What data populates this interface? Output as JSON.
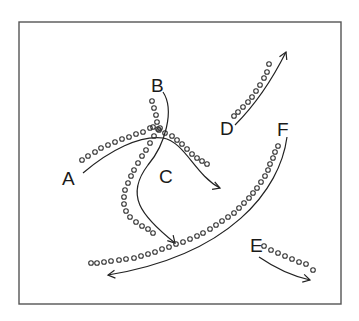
{
  "diagram": {
    "frame": {
      "x": 19,
      "y": 22,
      "width": 322,
      "height": 282,
      "stroke": "#555555"
    },
    "labels": [
      {
        "id": "A",
        "text": "A",
        "x": 62,
        "y": 185
      },
      {
        "id": "B",
        "text": "B",
        "x": 151,
        "y": 92
      },
      {
        "id": "C",
        "text": "C",
        "x": 159,
        "y": 183
      },
      {
        "id": "D",
        "text": "D",
        "x": 220,
        "y": 135
      },
      {
        "id": "E",
        "text": "E",
        "x": 250,
        "y": 252
      },
      {
        "id": "F",
        "text": "F",
        "x": 277,
        "y": 136
      }
    ],
    "paths": [
      {
        "id": "A",
        "d": "M83,173 C110,150 140,135 163,138 C185,142 195,175 220,188",
        "arrow_end": [
          220,
          188
        ],
        "arrow_dir": [
          1,
          0.35
        ]
      },
      {
        "id": "B",
        "d": "M163,92 C175,110 165,145 148,165 C125,195 140,215 175,243",
        "arrow_end": [
          175,
          243
        ],
        "arrow_dir": [
          0.7,
          0.75
        ]
      },
      {
        "id": "D",
        "d": "M235,125 C255,105 272,80 286,52",
        "arrow_end": [
          286,
          52
        ],
        "arrow_dir": [
          0.45,
          -1
        ]
      },
      {
        "id": "F",
        "d": "M287,137 C280,190 230,255 108,275",
        "arrow_end": [
          108,
          275
        ],
        "arrow_dir": [
          -1,
          0.12
        ]
      },
      {
        "id": "E",
        "d": "M259,257 C275,268 292,276 310,280",
        "arrow_end": [
          310,
          280
        ],
        "arrow_dir": [
          1,
          0.25
        ]
      }
    ],
    "dot_rows": [
      {
        "id": "A-dots",
        "points": [
          [
            82,
            160
          ],
          [
            88,
            156
          ],
          [
            95,
            152
          ],
          [
            101,
            148
          ],
          [
            108,
            145
          ],
          [
            115,
            142
          ],
          [
            122,
            139
          ],
          [
            129,
            137
          ],
          [
            136,
            134
          ],
          [
            143,
            132
          ],
          [
            150,
            128
          ],
          [
            153,
            127
          ]
        ]
      },
      {
        "id": "AC-dots",
        "points": [
          [
            158,
            129
          ],
          [
            165,
            133
          ],
          [
            172,
            136
          ],
          [
            177,
            140
          ],
          [
            182,
            144
          ],
          [
            187,
            149
          ],
          [
            192,
            154
          ],
          [
            197,
            158
          ],
          [
            202,
            161
          ],
          [
            207,
            164
          ]
        ]
      },
      {
        "id": "B-dots",
        "points": [
          [
            152,
            101
          ],
          [
            154,
            108
          ],
          [
            156,
            115
          ],
          [
            157,
            122
          ],
          [
            159,
            130
          ],
          [
            160,
            128
          ],
          [
            154,
            136
          ],
          [
            150,
            143
          ],
          [
            146,
            150
          ],
          [
            142,
            156
          ],
          [
            138,
            163
          ],
          [
            134,
            170
          ],
          [
            131,
            176
          ],
          [
            128,
            183
          ],
          [
            125,
            190
          ],
          [
            124,
            197
          ],
          [
            124,
            204
          ],
          [
            126,
            211
          ],
          [
            130,
            217
          ],
          [
            136,
            222
          ],
          [
            142,
            226
          ],
          [
            148,
            229
          ],
          [
            153,
            233
          ]
        ]
      },
      {
        "id": "D-dots",
        "points": [
          [
            234,
            116
          ],
          [
            238,
            112
          ],
          [
            243,
            107
          ],
          [
            248,
            102
          ],
          [
            252,
            97
          ],
          [
            256,
            91
          ],
          [
            260,
            85
          ],
          [
            264,
            78
          ],
          [
            267,
            72
          ],
          [
            269,
            64
          ]
        ]
      },
      {
        "id": "F-dots",
        "points": [
          [
            278,
            146
          ],
          [
            275,
            152
          ],
          [
            273,
            158
          ],
          [
            270,
            164
          ],
          [
            268,
            170
          ],
          [
            265,
            176
          ],
          [
            261,
            182
          ],
          [
            257,
            188
          ],
          [
            253,
            193
          ],
          [
            249,
            198
          ],
          [
            244,
            203
          ],
          [
            239,
            208
          ],
          [
            234,
            213
          ],
          [
            228,
            217
          ],
          [
            222,
            221
          ],
          [
            216,
            225
          ],
          [
            210,
            229
          ],
          [
            203,
            233
          ],
          [
            197,
            236
          ],
          [
            190,
            239
          ],
          [
            183,
            242
          ],
          [
            176,
            244
          ],
          [
            169,
            247
          ],
          [
            162,
            249
          ],
          [
            155,
            252
          ],
          [
            148,
            254
          ],
          [
            141,
            256
          ],
          [
            134,
            258
          ],
          [
            126,
            259
          ],
          [
            119,
            260
          ],
          [
            111,
            261
          ],
          [
            104,
            262
          ],
          [
            97,
            263
          ],
          [
            91,
            263
          ]
        ]
      },
      {
        "id": "E-dots",
        "points": [
          [
            264,
            246
          ],
          [
            271,
            250
          ],
          [
            278,
            253
          ],
          [
            285,
            256
          ],
          [
            292,
            259
          ],
          [
            299,
            262
          ],
          [
            306,
            264
          ],
          [
            313,
            270
          ]
        ]
      }
    ]
  }
}
